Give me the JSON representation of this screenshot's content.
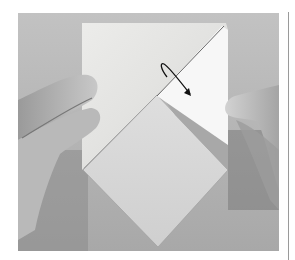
{
  "image": {
    "description": "Origami folding step photo: two hands holding a paper with a diamond base and a folded right flap; curved arrow indicates folding direction",
    "colors": {
      "background": "#bdbdbd",
      "paper": "#e4e4e2",
      "flap": "#f6f6f6",
      "shadow": "#8c8c8c",
      "hand": "#b0b0b0",
      "arrow": "#111111",
      "rule": "#9a9a9a"
    },
    "elements": [
      "left-hand",
      "right-hand",
      "paper-sheet",
      "diamond-fold",
      "right-flap",
      "fold-arrow",
      "vertical-rule"
    ]
  }
}
